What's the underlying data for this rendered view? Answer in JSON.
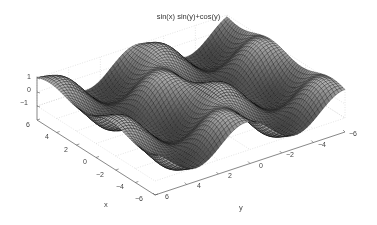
{
  "chart_data": {
    "type": "surface-mesh",
    "title": "sin(x) sin(y)+cos(y)",
    "function": "z = sin(x)*sin(y) + cos(y)",
    "xlabel": "x",
    "ylabel": "y",
    "zlabel": "",
    "xlim": [
      -6,
      6
    ],
    "ylim": [
      -6,
      6
    ],
    "zlim": [
      -1,
      1
    ],
    "xticks": [
      -6,
      -4,
      -2,
      0,
      2,
      4,
      6
    ],
    "yticks": [
      -6,
      -4,
      -2,
      0,
      2,
      4,
      6
    ],
    "zticks": [
      -1,
      0,
      1
    ],
    "grid": true,
    "colormap": "gray",
    "mesh_color": "#000000"
  },
  "labels": {
    "title": "sin(x) sin(y)+cos(y)",
    "x_axis": "x",
    "y_axis": "y",
    "xticks": [
      "6",
      "4",
      "2",
      "0",
      "−2",
      "−4",
      "−6"
    ],
    "yticks": [
      "6",
      "4",
      "2",
      "0",
      "−2",
      "−4",
      "−6"
    ],
    "zticks": [
      "1",
      "0",
      "−1"
    ]
  }
}
